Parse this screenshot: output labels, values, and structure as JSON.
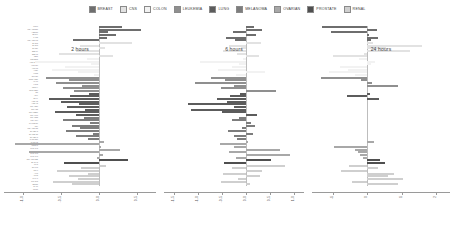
{
  "legend": {
    "items": [
      {
        "label": "BREAST",
        "color": "#6e6e6e"
      },
      {
        "label": "CNS",
        "color": "#e2e2e2"
      },
      {
        "label": "COLON",
        "color": "#f2f2f2"
      },
      {
        "label": "LEUKEMIA",
        "color": "#8f8f8f"
      },
      {
        "label": "LUNG",
        "color": "#5c5c5c"
      },
      {
        "label": "MELANOMA",
        "color": "#7d7d7d"
      },
      {
        "label": "OVARIAN",
        "color": "#a8a8a8"
      },
      {
        "label": "PROSTATE",
        "color": "#4f4f4f"
      },
      {
        "label": "RENAL",
        "color": "#cfcfcf"
      }
    ]
  },
  "chart_data": {
    "type": "bar",
    "orientation": "horizontal",
    "title": "",
    "xlabel": "",
    "ylabel": "",
    "grid": false,
    "legend_position": "top-center",
    "group_colors": {
      "BREAST": "#6e6e6e",
      "CNS": "#e2e2e2",
      "COLON": "#f2f2f2",
      "LEUKEMIA": "#8f8f8f",
      "LUNG": "#5c5c5c",
      "MELANOMA": "#7d7d7d",
      "OVARIAN": "#a8a8a8",
      "PROSTATE": "#4f4f4f",
      "RENAL": "#cfcfcf"
    },
    "categories": [
      "MCF7",
      "MDA-MB-231",
      "HS578T",
      "BT-549",
      "T-47D",
      "MDA-MB-468",
      "SF-268",
      "SF-295",
      "SF-539",
      "SNB-19",
      "SNB-75",
      "U251",
      "COLO205",
      "HCC-2998",
      "HCT-116",
      "HCT-15",
      "HT29",
      "KM12",
      "SW-620",
      "CCRF-CEM",
      "HL-60",
      "K-562",
      "MOLT-4",
      "RPMI-8226",
      "SR",
      "A549",
      "EKVX",
      "HOP-62",
      "HOP-92",
      "NCI-H226",
      "NCI-H23",
      "NCI-H322M",
      "NCI-H460",
      "NCI-H522",
      "LOX IMVI",
      "MALME-3M",
      "M14",
      "MDA-MB-435",
      "SK-MEL-2",
      "SK-MEL-28",
      "SK-MEL-5",
      "UACC-257",
      "UACC-62",
      "IGROV1",
      "OVCAR-3",
      "OVCAR-4",
      "OVCAR-5",
      "OVCAR-8",
      "NCI-ADR-RES",
      "SK-OV-3",
      "PC-3",
      "DU-145",
      "786-0",
      "A498",
      "ACHN",
      "CAKI-1",
      "RXF 393",
      "SN12C",
      "TK-10",
      "UO-31"
    ],
    "groups": [
      "BREAST",
      "BREAST",
      "BREAST",
      "BREAST",
      "BREAST",
      "BREAST",
      "CNS",
      "CNS",
      "CNS",
      "CNS",
      "CNS",
      "CNS",
      "COLON",
      "COLON",
      "COLON",
      "COLON",
      "COLON",
      "COLON",
      "COLON",
      "LEUKEMIA",
      "LEUKEMIA",
      "LEUKEMIA",
      "LEUKEMIA",
      "LEUKEMIA",
      "LEUKEMIA",
      "LUNG",
      "LUNG",
      "LUNG",
      "LUNG",
      "LUNG",
      "LUNG",
      "LUNG",
      "LUNG",
      "LUNG",
      "MELANOMA",
      "MELANOMA",
      "MELANOMA",
      "MELANOMA",
      "MELANOMA",
      "MELANOMA",
      "MELANOMA",
      "MELANOMA",
      "MELANOMA",
      "OVARIAN",
      "OVARIAN",
      "OVARIAN",
      "OVARIAN",
      "OVARIAN",
      "OVARIAN",
      "OVARIAN",
      "PROSTATE",
      "PROSTATE",
      "RENAL",
      "RENAL",
      "RENAL",
      "RENAL",
      "RENAL",
      "RENAL",
      "RENAL",
      "RENAL"
    ],
    "panels": [
      {
        "name": "2 hours",
        "xlim": [
          -1.25,
          0.75
        ],
        "ticks": [
          -1.0,
          -0.5,
          0.0,
          0.5
        ],
        "tick_labels": [
          "-1.0",
          "-0.5",
          "0.0",
          "0.5"
        ],
        "values": [
          0.3,
          0.55,
          0.12,
          0.22,
          0.1,
          -0.34,
          0.44,
          -0.25,
          0.08,
          -0.3,
          -0.52,
          0.18,
          -0.16,
          -0.84,
          -0.1,
          -0.45,
          -0.62,
          -0.28,
          -0.07,
          -0.7,
          -0.4,
          -0.56,
          -0.22,
          -0.48,
          -0.33,
          -0.13,
          -0.38,
          -0.66,
          -0.5,
          -0.26,
          -0.42,
          -0.18,
          -0.58,
          -0.3,
          -0.2,
          -0.47,
          -0.12,
          -0.36,
          -0.25,
          -0.44,
          -0.08,
          -0.3,
          -0.15,
          0.06,
          -1.1,
          0.02,
          0.28,
          -0.92,
          0.05,
          -0.03,
          0.38,
          -0.46,
          0.09,
          -0.24,
          -0.55,
          -0.14,
          -0.4,
          -0.27,
          -0.6,
          -0.35
        ]
      },
      {
        "name": "6 hours",
        "xlim": [
          -1.7,
          1.2
        ],
        "ticks": [
          -1.5,
          -1.0,
          -0.5,
          0.0,
          0.5,
          1.0
        ],
        "tick_labels": [
          "-1.5",
          "-1.0",
          "-0.5",
          "0.0",
          "0.5",
          "1.0"
        ],
        "values": [
          0.16,
          0.34,
          -0.28,
          0.2,
          -0.42,
          -0.22,
          0.3,
          -0.36,
          -0.1,
          -0.48,
          -0.18,
          0.26,
          -0.06,
          -0.95,
          -0.14,
          -0.3,
          -0.58,
          0.4,
          -0.2,
          -0.72,
          -0.44,
          -1.05,
          -0.26,
          -0.52,
          0.62,
          -0.12,
          -0.33,
          -0.6,
          -0.4,
          -1.2,
          -0.25,
          -1.15,
          -0.5,
          0.22,
          -0.15,
          -0.3,
          0.1,
          0.18,
          -0.08,
          -0.38,
          0.14,
          -0.24,
          -0.18,
          0.05,
          -0.55,
          -0.26,
          0.7,
          -0.35,
          0.9,
          -0.2,
          0.52,
          -0.45,
          0.8,
          -0.3,
          0.34,
          -0.48,
          0.28,
          -0.16,
          -0.52,
          0.08
        ]
      },
      {
        "name": "24 hours",
        "xlim": [
          -1.6,
          2.4
        ],
        "ticks": [
          -1.0,
          0.0,
          1.0,
          2.0
        ],
        "tick_labels": [
          "-1",
          "0",
          "1",
          "2"
        ],
        "values": [
          -1.3,
          0.28,
          -1.05,
          0.06,
          0.3,
          0.12,
          0.18,
          1.6,
          0.55,
          1.25,
          -0.08,
          -1.0,
          -0.25,
          0.22,
          0.1,
          -0.8,
          -0.55,
          -1.1,
          -0.35,
          -1.35,
          -0.18,
          0.15,
          0.9,
          null,
          null,
          0.08,
          -0.6,
          0.35,
          null,
          null,
          null,
          null,
          null,
          null,
          null,
          null,
          null,
          null,
          null,
          null,
          null,
          null,
          null,
          0.2,
          null,
          -0.95,
          -0.35,
          -0.28,
          -0.2,
          -0.12,
          0.38,
          0.52,
          -0.52,
          0.3,
          -0.75,
          0.78,
          0.6,
          1.05,
          -0.45,
          0.88
        ]
      }
    ]
  }
}
